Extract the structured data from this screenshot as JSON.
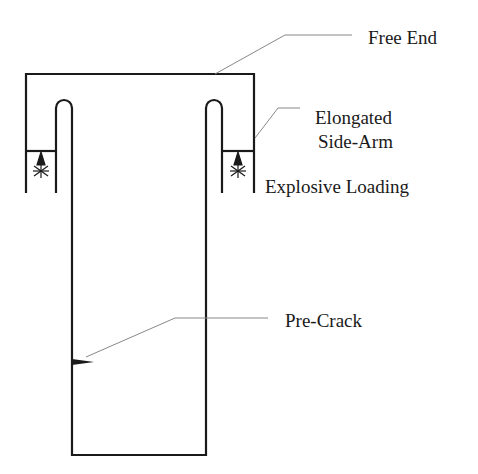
{
  "diagram": {
    "labels": {
      "free_end": "Free End",
      "side_arm_line1": "Elongated",
      "side_arm_line2": "Side-Arm",
      "explosive_loading": "Explosive Loading",
      "pre_crack": "Pre-Crack"
    },
    "colors": {
      "outline": "#1a1a1a",
      "leader": "#888888",
      "background": "#ffffff"
    },
    "icons": [
      "explosive-charge-icon"
    ]
  }
}
